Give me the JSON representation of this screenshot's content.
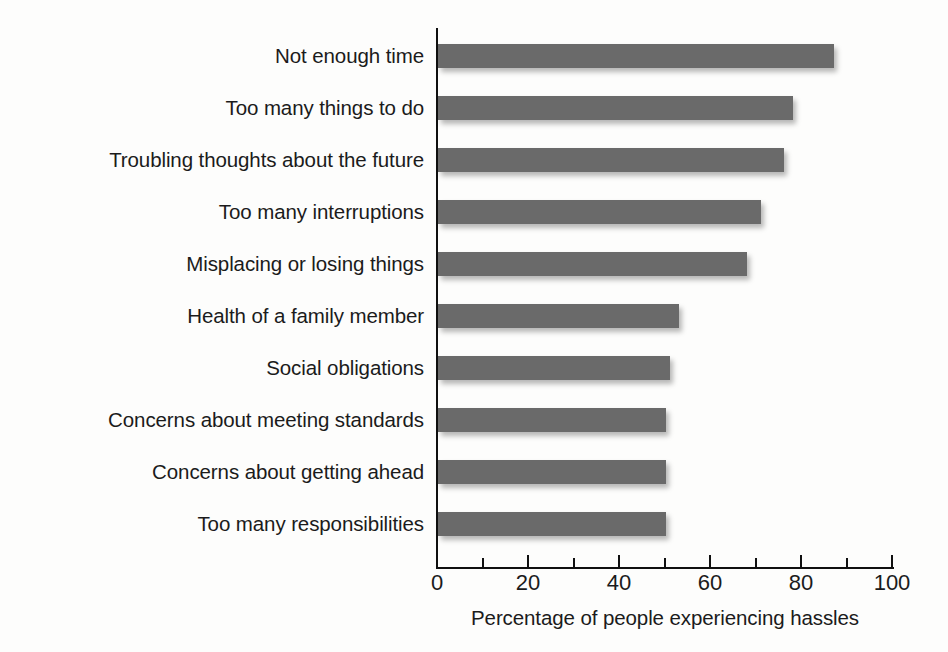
{
  "chart_data": {
    "type": "bar",
    "orientation": "horizontal",
    "title": "",
    "xlabel": "Percentage of people experiencing hassles",
    "ylabel": "",
    "xlim": [
      0,
      100
    ],
    "grid": false,
    "legend": null,
    "bar_color": "#6a6a6a",
    "axis_color": "#101010",
    "background_color": "#fdfdfc",
    "x_ticks_major": [
      0,
      20,
      40,
      60,
      80,
      100
    ],
    "x_tick_labels": [
      "0",
      "20",
      "40",
      "60",
      "80",
      "100"
    ],
    "x_ticks_minor": [
      10,
      30,
      50,
      70,
      90
    ],
    "categories": [
      "Not enough time",
      "Too many things to do",
      "Troubling thoughts about the future",
      "Too many interruptions",
      "Misplacing or losing things",
      "Health of a family member",
      "Social obligations",
      "Concerns about meeting standards",
      "Concerns about getting ahead",
      "Too many responsibilities"
    ],
    "values": [
      87,
      78,
      76,
      71,
      68,
      53,
      51,
      50,
      50,
      50
    ]
  }
}
